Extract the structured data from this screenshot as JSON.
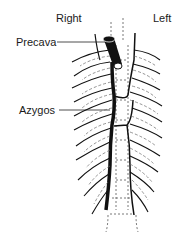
{
  "diagram": {
    "labels": {
      "right": "Right",
      "left": "Left",
      "precava": "Precava",
      "azygos": "Azygos"
    },
    "colors": {
      "line": "#111111",
      "dashed": "#555555",
      "background": "#ffffff"
    }
  }
}
